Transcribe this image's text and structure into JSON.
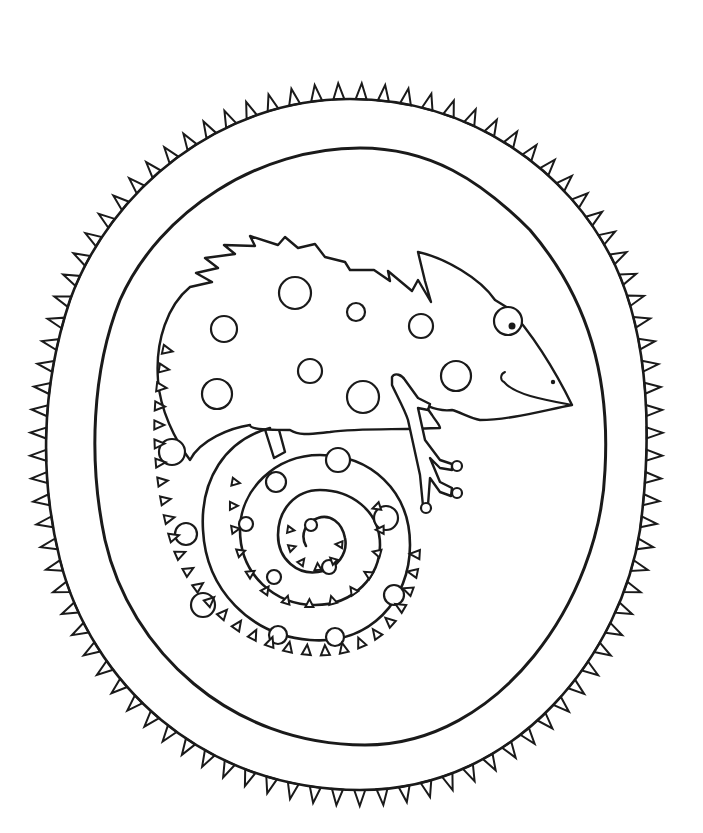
{
  "image": {
    "kind": "coloring-page",
    "subject": "chameleon",
    "description": "Black-and-white line art of a spotted chameleon with a spiral tail inside a double oval frame with triangular spikes around the outer edge",
    "colors": {
      "background": "#ffffff",
      "ink": "#1a1a1a"
    },
    "elements": {
      "frame": {
        "shape": "egg-oval",
        "rings": 2,
        "outer_edge": "triangular-spikes"
      },
      "chameleon": {
        "facing": "right",
        "features": [
          "spiky crest",
          "head casque",
          "round eye with pupil",
          "smile",
          "nostril",
          "front leg with three toes",
          "back leg",
          "spiral tail with spikes"
        ],
        "pattern": "circle spots"
      }
    }
  }
}
